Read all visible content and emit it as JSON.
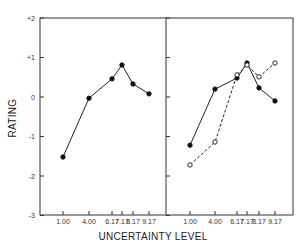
{
  "chart_data": [
    {
      "type": "line",
      "panel": "left",
      "title": "",
      "xlabel": "UNCERTAINTY LEVEL",
      "ylabel": "RATING",
      "categories": [
        "1.00",
        "4.00",
        "6.17",
        "7.17",
        "8.17",
        "9.17"
      ],
      "x": [
        1.0,
        4.0,
        6.17,
        7.17,
        8.17,
        9.17
      ],
      "series": [
        {
          "name": "closed",
          "marker": "filled-circle",
          "line": "solid",
          "values": [
            -1.52,
            -0.03,
            0.46,
            0.81,
            0.33,
            0.08
          ]
        }
      ],
      "ylim": [
        -3,
        2
      ],
      "yticks": [
        "+2",
        "+1",
        "0",
        "-1",
        "-2",
        "-3"
      ],
      "grid": false,
      "legend": null
    },
    {
      "type": "line",
      "panel": "right",
      "title": "",
      "xlabel": "UNCERTAINTY LEVEL",
      "ylabel": "RATING",
      "categories": [
        "1.00",
        "4.00",
        "6.17",
        "7.17",
        "8.17",
        "9.17"
      ],
      "x": [
        1.0,
        4.0,
        6.17,
        7.17,
        8.17,
        9.17
      ],
      "series": [
        {
          "name": "closed",
          "marker": "filled-circle",
          "line": "solid",
          "values": [
            -1.22,
            0.2,
            0.48,
            0.86,
            0.23,
            -0.1
          ]
        },
        {
          "name": "open",
          "marker": "open-circle",
          "line": "dashed",
          "values": [
            -1.72,
            -1.14,
            0.56,
            0.81,
            0.51,
            0.86
          ]
        }
      ],
      "ylim": [
        -3,
        2
      ],
      "grid": false,
      "legend": null
    }
  ],
  "labels": {
    "ylabel": "RATING",
    "xlabel": "UNCERTAINTY LEVEL",
    "yticks": [
      "+2",
      "+1",
      "0",
      "-1",
      "-2",
      "-3"
    ],
    "xticks": [
      "1.00",
      "4.00",
      "6.17",
      "7.17",
      "8.17",
      "9.17"
    ]
  }
}
